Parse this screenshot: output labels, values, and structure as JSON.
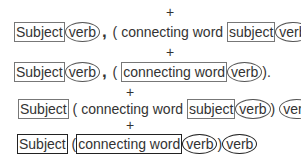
{
  "plus_sign": "+",
  "rows": [
    {
      "subject": "Subject",
      "verb": "verb",
      "comma": ",",
      "open_paren": " ( ",
      "connecting_word": "connecting word ",
      "inner_subject": "subject",
      "inner_verb": "verb",
      "close": " )."
    },
    {
      "subject": "Subject",
      "verb": "verb",
      "comma": ",",
      "open_paren": " ( ",
      "connecting_word": "connecting word ",
      "inner_verb": "verb",
      "close": ")."
    },
    {
      "subject": "Subject",
      "open_paren": " ( connecting word ",
      "inner_subject": "subject",
      "inner_verb": "verb",
      "close_paren": ") ",
      "verb": "verb"
    },
    {
      "subject": "Subject",
      "open_paren": " (",
      "connecting_word": "connecting word ",
      "inner_verb": "verb",
      "close_paren": ")",
      "verb": "verb"
    }
  ]
}
